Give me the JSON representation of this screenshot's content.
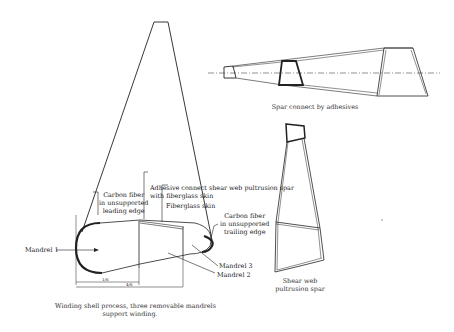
{
  "figure": {
    "panels": {
      "shell": {
        "labels": {
          "mandrel1": "Mandrel 1",
          "mandrel2": "Mandrel 2",
          "mandrel3": "Mandrel 3",
          "carbon_leading_1": "Carbon fiber",
          "carbon_leading_2": "in unsupported",
          "carbon_leading_3": "leading edge",
          "adhesive_1": "Adhesive connect shear web pultrusion spar",
          "adhesive_2": "with fiberglass skin",
          "fiberglass": "Fiberglass skin",
          "carbon_trailing_1": "Carbon fiber",
          "carbon_trailing_2": "in unsupported",
          "carbon_trailing_3": "trailing edge",
          "dim_short": "1/6",
          "dim_long": "4/6"
        },
        "caption_1": "Winding shell process, three removable mandrels",
        "caption_2": "support winding."
      },
      "spar_assembly": {
        "caption": "Spar connect by adhesives"
      },
      "shear_web": {
        "caption_1": "Shear web",
        "caption_2": "pultrusion spar"
      }
    }
  }
}
